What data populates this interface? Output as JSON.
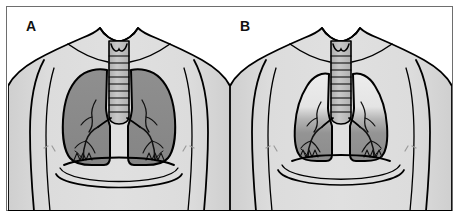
{
  "figure": {
    "kind": "medical-illustration",
    "panel_count": 2,
    "border_color": "#6e6e6e",
    "background_color": "#ffffff"
  },
  "palette": {
    "body_fill": "#d9d9d9",
    "body_outline": "#000000",
    "lung_normal_fill": "#8a8a8a",
    "lung_light_fill": "#e8e8e8",
    "lung_dark_fill": "#8f8f8f",
    "trachea_fill": "#bcbcbc",
    "outline_color": "#000000",
    "label_color": "#111111",
    "nipple_mark_color": "#9a9a9a"
  },
  "panels": [
    {
      "id": "panel-a",
      "label": "A",
      "lung_state": "normal",
      "lung_fill": "#8a8a8a",
      "lung_fill_upper": "#8a8a8a",
      "lung_fill_lower": "#8a8a8a",
      "lung_width": "wide",
      "lung_height": "tall",
      "description": "Normal lungs filling the thoracic cavity uniformly shaded"
    },
    {
      "id": "panel-b",
      "label": "B",
      "lung_state": "reduced-volume",
      "lung_fill": "#e8e8e8",
      "lung_fill_upper": "#e8e8e8",
      "lung_fill_lower": "#8f8f8f",
      "lung_width": "narrow",
      "lung_height": "short",
      "description": "Narrowed lungs with pale upper zones and darker dependent lower zones"
    }
  ],
  "anatomy_parts": [
    "torso-outline",
    "neck",
    "clavicle-shoulder-line",
    "trachea",
    "larynx",
    "carina",
    "left-lung",
    "right-lung",
    "bronchial-tree",
    "alveolar-marks",
    "diaphragm",
    "nipple-mark"
  ]
}
